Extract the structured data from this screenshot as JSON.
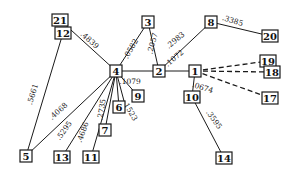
{
  "diagram": {
    "type": "weighted-network-graph",
    "nodes": [
      {
        "id": "21",
        "label": "21",
        "x": 60,
        "y": 20
      },
      {
        "id": "12",
        "label": "12",
        "x": 63,
        "y": 33
      },
      {
        "id": "4",
        "label": "4",
        "x": 116,
        "y": 71
      },
      {
        "id": "3",
        "label": "3",
        "x": 148,
        "y": 22
      },
      {
        "id": "8",
        "label": "8",
        "x": 211,
        "y": 22
      },
      {
        "id": "20",
        "label": "20",
        "x": 270,
        "y": 36
      },
      {
        "id": "2",
        "label": "2",
        "x": 159,
        "y": 71
      },
      {
        "id": "1",
        "label": "1",
        "x": 195,
        "y": 71
      },
      {
        "id": "19",
        "label": "19",
        "x": 268,
        "y": 61
      },
      {
        "id": "18",
        "label": "18",
        "x": 272,
        "y": 72
      },
      {
        "id": "17",
        "label": "17",
        "x": 270,
        "y": 98
      },
      {
        "id": "10",
        "label": "10",
        "x": 192,
        "y": 97
      },
      {
        "id": "14",
        "label": "14",
        "x": 224,
        "y": 158
      },
      {
        "id": "9",
        "label": "9",
        "x": 138,
        "y": 96
      },
      {
        "id": "6",
        "label": "6",
        "x": 119,
        "y": 107
      },
      {
        "id": "7",
        "label": "7",
        "x": 105,
        "y": 130
      },
      {
        "id": "5",
        "label": "5",
        "x": 26,
        "y": 156
      },
      {
        "id": "13",
        "label": "13",
        "x": 62,
        "y": 157
      },
      {
        "id": "11",
        "label": "11",
        "x": 91,
        "y": 157
      }
    ],
    "edges": [
      {
        "from": "21",
        "to": "4",
        "weight": ".4839",
        "style": "solid",
        "lx": 88,
        "ly": 42,
        "rot": 42
      },
      {
        "from": "12",
        "to": "5",
        "weight": ".5661",
        "style": "solid",
        "lx": 35,
        "ly": 95,
        "rot": -72
      },
      {
        "from": "4",
        "to": "5",
        "weight": ".4068",
        "style": "solid",
        "lx": 60,
        "ly": 113,
        "rot": -42
      },
      {
        "from": "4",
        "to": "13",
        "weight": ".5295",
        "style": "solid",
        "lx": 66,
        "ly": 132,
        "rot": -55
      },
      {
        "from": "4",
        "to": "11",
        "weight": ".4686",
        "style": "solid",
        "lx": 85,
        "ly": 133,
        "rot": -70
      },
      {
        "from": "4",
        "to": "7",
        "weight": ".2735",
        "style": "solid",
        "lx": 104,
        "ly": 110,
        "rot": -80
      },
      {
        "from": "4",
        "to": "6",
        "weight": "",
        "style": "solid",
        "lx": 0,
        "ly": 0,
        "rot": 0
      },
      {
        "from": "4",
        "to": "9",
        "weight": ".1079",
        "style": "solid",
        "lx": 130,
        "ly": 84,
        "rot": 0
      },
      {
        "from": "4",
        "to": "6b",
        "weight": ".1523",
        "style": "solid",
        "lx": 128,
        "ly": 112,
        "rot": 60
      },
      {
        "from": "4",
        "to": "3",
        "weight": ".0582",
        "style": "solid",
        "lx": 133,
        "ly": 50,
        "rot": -60
      },
      {
        "from": "4",
        "to": "2",
        "weight": "",
        "style": "solid",
        "lx": 0,
        "ly": 0,
        "rot": 0
      },
      {
        "from": "3",
        "to": "2",
        "weight": ".2057",
        "style": "solid",
        "lx": 155,
        "ly": 44,
        "rot": -75
      },
      {
        "from": "2",
        "to": "8",
        "weight": ".2983",
        "style": "solid",
        "lx": 177,
        "ly": 42,
        "rot": -40
      },
      {
        "from": "2",
        "to": "1",
        "weight": ".1072",
        "style": "solid",
        "lx": 176,
        "ly": 60,
        "rot": -40
      },
      {
        "from": "8",
        "to": "20",
        "weight": ".3385",
        "style": "solid",
        "lx": 232,
        "ly": 23,
        "rot": 18
      },
      {
        "from": "1",
        "to": "19",
        "weight": "",
        "style": "dashed",
        "lx": 0,
        "ly": 0,
        "rot": 0
      },
      {
        "from": "1",
        "to": "18",
        "weight": "",
        "style": "dashed",
        "lx": 0,
        "ly": 0,
        "rot": 0
      },
      {
        "from": "1",
        "to": "17",
        "weight": "",
        "style": "dashed",
        "lx": 0,
        "ly": 0,
        "rot": 0
      },
      {
        "from": "1",
        "to": "10",
        "weight": ".0674",
        "style": "solid",
        "lx": 202,
        "ly": 90,
        "rot": 18
      },
      {
        "from": "10",
        "to": "14",
        "weight": ".3595",
        "style": "solid",
        "lx": 212,
        "ly": 121,
        "rot": 55
      }
    ]
  }
}
